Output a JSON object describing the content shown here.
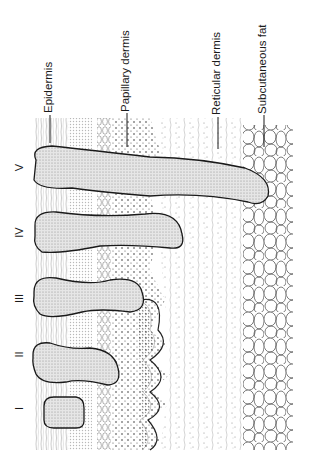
{
  "figure": {
    "layers": [
      {
        "label": "Epidermis"
      },
      {
        "label": "Papillary dermis"
      },
      {
        "label": "Reticular dermis"
      },
      {
        "label": "Subcutaneous fat"
      }
    ],
    "degrees": [
      {
        "numeral": "I"
      },
      {
        "numeral": "II"
      },
      {
        "numeral": "III"
      },
      {
        "numeral": "IV"
      },
      {
        "numeral": "V"
      }
    ],
    "colors": {
      "line": "#1a1a1a",
      "burn_fill": "#d9d9d9",
      "background": "#ffffff"
    }
  }
}
